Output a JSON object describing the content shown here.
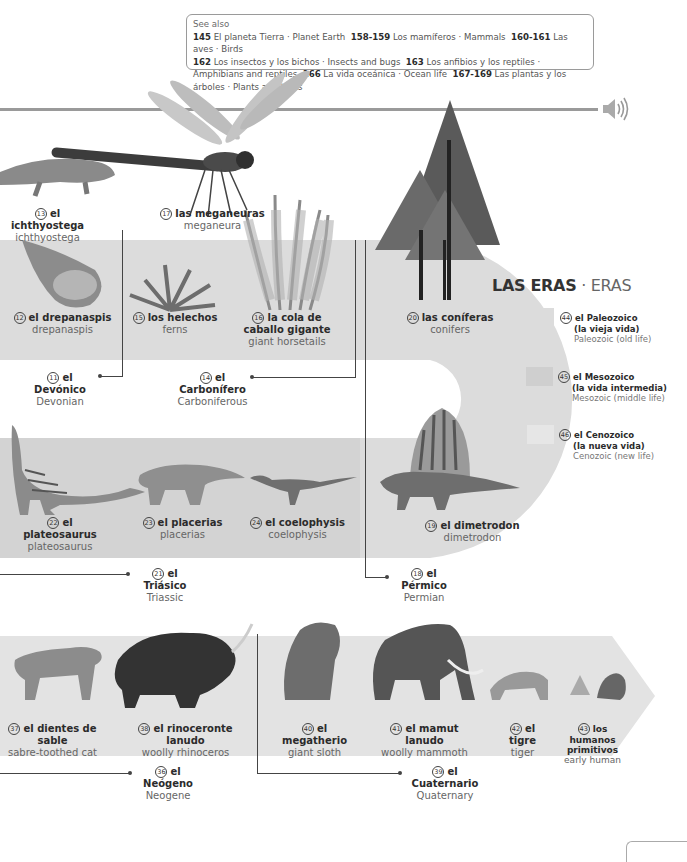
{
  "see_also": {
    "header": "See also",
    "refs": [
      {
        "pages": "145",
        "es": "El planeta Tierra",
        "en": "Planet Earth"
      },
      {
        "pages": "158-159",
        "es": "Los mamíferos",
        "en": "Mammals"
      },
      {
        "pages": "160-161",
        "es": "Las aves",
        "en": "Birds"
      },
      {
        "pages": "162",
        "es": "Los insectos y los bichos",
        "en": "Insects and bugs"
      },
      {
        "pages": "163",
        "es": "Los anfibios y los reptiles",
        "en": "Amphibians and reptiles"
      },
      {
        "pages": "166",
        "es": "La vida oceánica",
        "en": "Ocean life"
      },
      {
        "pages": "167-169",
        "es": "Las plantas y los árboles",
        "en": "Plants and trees"
      }
    ]
  },
  "audio": {
    "icon": "speaker-icon"
  },
  "items": {
    "i13": {
      "num": "13",
      "es": "el ichthyostega",
      "en": "ichthyostega"
    },
    "i17": {
      "num": "17",
      "es": "las meganeuras",
      "en": "meganeura"
    },
    "i12": {
      "num": "12",
      "es": "el drepanaspis",
      "en": "drepanaspis"
    },
    "i15": {
      "num": "15",
      "es": "los helechos",
      "en": "ferns"
    },
    "i16": {
      "num": "16",
      "es": "la cola de caballo gigante",
      "en": "giant horsetails"
    },
    "i20": {
      "num": "20",
      "es": "las coníferas",
      "en": "conifers"
    },
    "i11": {
      "num": "11",
      "es": "el Devónico",
      "en": "Devonian"
    },
    "i14": {
      "num": "14",
      "es": "el Carbonífero",
      "en": "Carboniferous"
    },
    "i22": {
      "num": "22",
      "es": "el plateosaurus",
      "en": "plateosaurus"
    },
    "i23": {
      "num": "23",
      "es": "el placerias",
      "en": "placerias"
    },
    "i24": {
      "num": "24",
      "es": "el coelophysis",
      "en": "coelophysis"
    },
    "i19": {
      "num": "19",
      "es": "el dimetrodon",
      "en": "dimetrodon"
    },
    "i21": {
      "num": "21",
      "es": "el Triásico",
      "en": "Triassic"
    },
    "i18": {
      "num": "18",
      "es": "el Pérmico",
      "en": "Permian"
    },
    "i37": {
      "num": "37",
      "es": "el dientes de sable",
      "en": "sabre-toothed cat"
    },
    "i38": {
      "num": "38",
      "es": "el rinoceronte lanudo",
      "en": "woolly rhinoceros"
    },
    "i40": {
      "num": "40",
      "es": "el megatherio",
      "en": "giant sloth"
    },
    "i41": {
      "num": "41",
      "es": "el mamut lanudo",
      "en": "woolly mammoth"
    },
    "i42": {
      "num": "42",
      "es": "el tigre",
      "en": "tiger"
    },
    "i43": {
      "num": "43",
      "es": "los humanos primitivos",
      "en": "early human"
    },
    "i36": {
      "num": "36",
      "es": "el Neógeno",
      "en": "Neogene"
    },
    "i39": {
      "num": "39",
      "es": "el Cuaternario",
      "en": "Quaternary"
    }
  },
  "legend": {
    "title_es": "LAS ERAS",
    "sep": " · ",
    "title_en": "ERAS",
    "eras": [
      {
        "num": "44",
        "es1": "el Paleozoico",
        "es2": "(la vieja vida)",
        "en": "Paleozoic (old life)",
        "color": "#dcdcdc"
      },
      {
        "num": "45",
        "es1": "el Mesozoico",
        "es2": "(la vida intermedia)",
        "en": "Mesozoic (middle life)",
        "color": "#cfcfcf"
      },
      {
        "num": "46",
        "es1": "el Cenozoico",
        "es2": "(la nueva vida)",
        "en": "Cenozoic (new life)",
        "color": "#e6e6e6"
      }
    ]
  },
  "colors": {
    "paleozoic": "#dcdcdc",
    "mesozoic": "#d3d3d3",
    "cenozoic": "#e3e3e3",
    "rule": "#9a9a9a"
  }
}
